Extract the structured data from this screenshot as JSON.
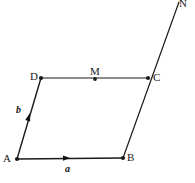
{
  "figure": {
    "name": "parallelogram-vector-diagram",
    "background_color": "#ffffff",
    "stroke_color": "#1a1a1a",
    "label_color": "#1a1a1a",
    "width": 195,
    "height": 183
  },
  "points": {
    "A": {
      "label": "A",
      "x": 17,
      "y": 159,
      "label_x": 3,
      "label_y": 153,
      "dot": true
    },
    "B": {
      "label": "B",
      "x": 123,
      "y": 158,
      "label_x": 127,
      "label_y": 152,
      "dot": true
    },
    "C": {
      "label": "C",
      "x": 148,
      "y": 78,
      "label_x": 153,
      "label_y": 72,
      "dot": true
    },
    "D": {
      "label": "D",
      "x": 41,
      "y": 78,
      "label_x": 30,
      "label_y": 71,
      "dot": true
    },
    "M": {
      "label": "M",
      "x": 95,
      "y": 79,
      "label_x": 90,
      "label_y": 66,
      "dot": true
    },
    "N": {
      "label": "N",
      "x": 179,
      "y": 2,
      "label_x": 179,
      "label_y": -2,
      "dot": false
    }
  },
  "segments": [
    {
      "name": "segment-AB",
      "from": "A",
      "to": "B"
    },
    {
      "name": "segment-AD",
      "from": "A",
      "to": "D"
    },
    {
      "name": "segment-DC",
      "from": "D",
      "to": "C"
    },
    {
      "name": "segment-BN",
      "from": "B",
      "to": "N"
    }
  ],
  "vectors": {
    "a": {
      "label": "a",
      "along": "segment-AB",
      "arrow_x": 70,
      "arrow_y": 158,
      "label_x": 65,
      "label_y": 164,
      "direction": "right"
    },
    "b": {
      "label": "b",
      "along": "segment-AD",
      "arrow_x": 30,
      "arrow_y": 113,
      "label_x": 16,
      "label_y": 105,
      "direction": "up"
    }
  },
  "icons": {
    "point_dot": "filled-dot",
    "vector_arrow": "arrowhead"
  }
}
